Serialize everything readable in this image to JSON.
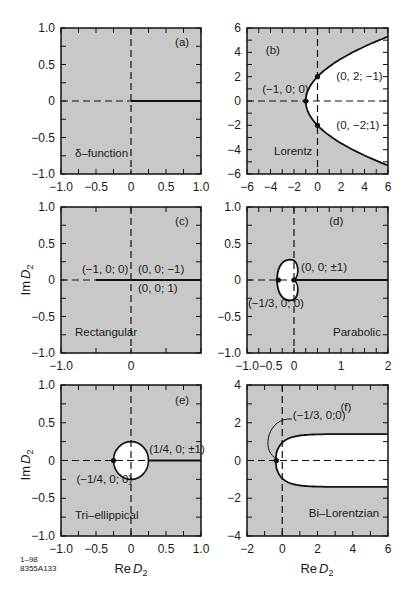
{
  "figure": {
    "id_line1": "1–98",
    "id_line2": "8355A133",
    "x_axis_title": "Re",
    "y_axis_title": "Im",
    "axis_var": "D",
    "axis_sub": "2",
    "shaded_color": "#c8c8c8",
    "line_color": "#111111"
  },
  "chart_data": [
    {
      "panel": "(a)",
      "type": "line",
      "name": "δ–function",
      "xlim": [
        -1.0,
        1.0
      ],
      "ylim": [
        -1.0,
        1.0
      ],
      "xticks": [
        "−1.0",
        "−0.5",
        "0",
        "0.5",
        "1.0"
      ],
      "xtick_vals": [
        -1,
        -0.5,
        0,
        0.5,
        1
      ],
      "yticks": [
        "1.0",
        "0.5",
        "0",
        "−0.5",
        "−1.0"
      ],
      "ytick_vals": [
        1,
        0.5,
        0,
        -0.5,
        -1
      ],
      "annotations": [],
      "description": "Stability boundary is the positive real axis (solid line from 0 to 1); rest shaded."
    },
    {
      "panel": "(b)",
      "type": "line",
      "name": "Lorentz",
      "xlim": [
        -6,
        6
      ],
      "ylim": [
        -6,
        6
      ],
      "xticks": [
        "−6",
        "−4",
        "−2",
        "0",
        "2",
        "4",
        "6"
      ],
      "xtick_vals": [
        -6,
        -4,
        -2,
        0,
        2,
        4,
        6
      ],
      "yticks": [
        "6",
        "4",
        "2",
        "0",
        "−2",
        "−4",
        "−6"
      ],
      "ytick_vals": [
        6,
        4,
        2,
        0,
        -2,
        -4,
        -6
      ],
      "annotations": [
        "(0, 2; −1)",
        "(−1, 0; 0)",
        "(0, −2;1)"
      ],
      "points": [
        [
          0,
          2
        ],
        [
          -1,
          0
        ],
        [
          0,
          -2
        ]
      ],
      "curve": "parabola Re = −1 + Im²/4, unshaded interior to the right"
    },
    {
      "panel": "(c)",
      "type": "line",
      "name": "Rectangular",
      "xlim": [
        -1.0,
        1.0
      ],
      "ylim": [
        -1.0,
        1.0
      ],
      "xticks": [
        "−1.0",
        "0"
      ],
      "xtick_vals": [
        -1,
        0
      ],
      "yticks": [
        "1.0",
        "0.5",
        "0",
        "−0.5",
        "−1.0"
      ],
      "ytick_vals": [
        1,
        0.5,
        0,
        -0.5,
        -1
      ],
      "annotations": [
        "(−1, 0; 0)",
        "(0, 0; −1)",
        "(0, 0; 1)"
      ],
      "description": "Solid line along real axis from −0.5 to 1"
    },
    {
      "panel": "(d)",
      "type": "line",
      "name": "Parabolic",
      "xlim": [
        -1.0,
        2.0
      ],
      "ylim": [
        -1.0,
        1.0
      ],
      "xticks": [
        "−1.0",
        "−0.5",
        "0",
        "1",
        "2"
      ],
      "xtick_vals": [
        -1,
        -0.5,
        0,
        1,
        2
      ],
      "yticks": [
        "1.0",
        "0.5",
        "0",
        "−0.5",
        "−1.0"
      ],
      "ytick_vals": [
        1,
        0.5,
        0,
        -0.5,
        -1
      ],
      "annotations": [
        "(0, 0; ±1)",
        "(−1/3, 0; 0)"
      ],
      "points": [
        [
          -0.333,
          0
        ],
        [
          0,
          0
        ]
      ],
      "description": "Heart-shaped (cardioid-like) unshaded region from −1/3 to 0, solid line along positive real axis"
    },
    {
      "panel": "(e)",
      "type": "line",
      "name": "Tri–ellippical",
      "xlim": [
        -1.0,
        1.0
      ],
      "ylim": [
        -1.0,
        1.0
      ],
      "xticks": [
        "−1.0",
        "−0.5",
        "0",
        "0.5",
        "1.0"
      ],
      "xtick_vals": [
        -1,
        -0.5,
        0,
        0.5,
        1
      ],
      "yticks": [
        "1.0",
        "0.5",
        "0",
        "−0.5",
        "−1.0"
      ],
      "ytick_vals": [
        1,
        0.5,
        0,
        -0.5,
        -1
      ],
      "annotations": [
        "(1/4, 0; ±1)",
        "(−1/4, 0; 0)"
      ],
      "points": [
        [
          -0.25,
          0
        ]
      ],
      "description": "Unshaded circle of radius 1/4 centered at origin, solid line along real axis from 1/4 to 1"
    },
    {
      "panel": "(f)",
      "type": "line",
      "name": "Bi–Lorentzian",
      "xlim": [
        -2,
        6
      ],
      "ylim": [
        -4,
        4
      ],
      "xticks": [
        "−2",
        "0",
        "2",
        "4",
        "6"
      ],
      "xtick_vals": [
        -2,
        0,
        2,
        4,
        6
      ],
      "yticks": [
        "4",
        "2",
        "0",
        "−2",
        "−4"
      ],
      "ytick_vals": [
        4,
        2,
        0,
        -2,
        -4
      ],
      "annotations": [
        "(−1/3, 0;0)"
      ],
      "points": [
        [
          -0.333,
          0
        ]
      ],
      "description": "Unshaded region bounded by curve opening right, asymptoting to Im ≈ ±1.4"
    }
  ]
}
